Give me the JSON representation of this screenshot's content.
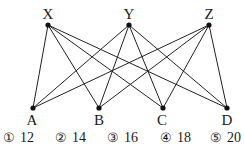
{
  "diagram": {
    "top_nodes": [
      {
        "id": "X",
        "label": "X",
        "x": 48,
        "y": 25
      },
      {
        "id": "Y",
        "label": "Y",
        "x": 129,
        "y": 25
      },
      {
        "id": "Z",
        "label": "Z",
        "x": 209,
        "y": 25
      }
    ],
    "bottom_nodes": [
      {
        "id": "A",
        "label": "A",
        "x": 33,
        "y": 108
      },
      {
        "id": "B",
        "label": "B",
        "x": 99,
        "y": 108
      },
      {
        "id": "C",
        "label": "C",
        "x": 163,
        "y": 108
      },
      {
        "id": "D",
        "label": "D",
        "x": 227,
        "y": 108
      }
    ],
    "edges": [
      [
        "X",
        "A"
      ],
      [
        "X",
        "B"
      ],
      [
        "X",
        "C"
      ],
      [
        "X",
        "D"
      ],
      [
        "Y",
        "A"
      ],
      [
        "Y",
        "B"
      ],
      [
        "Y",
        "C"
      ],
      [
        "Y",
        "D"
      ],
      [
        "Z",
        "A"
      ],
      [
        "Z",
        "B"
      ],
      [
        "Z",
        "C"
      ],
      [
        "Z",
        "D"
      ]
    ],
    "line_color": "#222222"
  },
  "choices": [
    {
      "marker": "①",
      "value": "12"
    },
    {
      "marker": "②",
      "value": "14"
    },
    {
      "marker": "③",
      "value": "16"
    },
    {
      "marker": "④",
      "value": "18"
    },
    {
      "marker": "⑤",
      "value": "20"
    }
  ]
}
